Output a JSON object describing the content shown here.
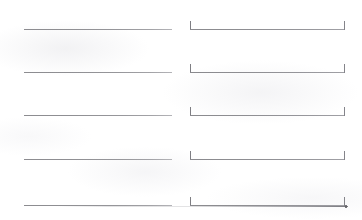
{
  "document": {
    "title": "Blank Form Fill-In Lines",
    "type": "scanned-form-fragment",
    "background_color": "#ffffff",
    "rule_color": "#8c8c90",
    "bracket_color": "#7e7e83",
    "columns": 2,
    "row_count": 5
  },
  "columns": [
    {
      "name": "left-column",
      "style": "plain-rule",
      "label": "",
      "value": "",
      "placeholder": ""
    },
    {
      "name": "right-column",
      "style": "bracketed-rule",
      "label": "",
      "value": "",
      "placeholder": "",
      "bracket_open": "[",
      "bracket_close": "]"
    }
  ],
  "rows": [
    {
      "index": 1,
      "left": {
        "value": "",
        "placeholder": ""
      },
      "right": {
        "value": "",
        "placeholder": "",
        "bracket_open": "[",
        "bracket_close": "]"
      }
    },
    {
      "index": 2,
      "left": {
        "value": "",
        "placeholder": ""
      },
      "right": {
        "value": "",
        "placeholder": "",
        "bracket_open": "[",
        "bracket_close": "]"
      }
    },
    {
      "index": 3,
      "left": {
        "value": "",
        "placeholder": ""
      },
      "right": {
        "value": "",
        "placeholder": "",
        "bracket_open": "[",
        "bracket_close": "]"
      }
    },
    {
      "index": 4,
      "left": {
        "value": "",
        "placeholder": ""
      },
      "right": {
        "value": "",
        "placeholder": "",
        "bracket_open": "[",
        "bracket_close": "]"
      }
    },
    {
      "index": 5,
      "left": {
        "value": "",
        "placeholder": ""
      },
      "right": {
        "value": "",
        "placeholder": "",
        "bracket_open": "[",
        "bracket_close": "]"
      }
    }
  ],
  "layout": {
    "row_tops": [
      16,
      59,
      102,
      146,
      192
    ],
    "left_field": {
      "x": 24,
      "width": 148
    },
    "right_field": {
      "x": 190,
      "width": 155
    },
    "bracket_height": 9
  },
  "artifacts": {
    "bottom_edge_line": "partial cut-off rule at bottom edge"
  }
}
